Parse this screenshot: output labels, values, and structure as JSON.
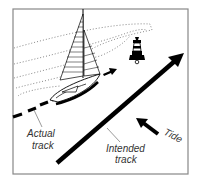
{
  "diagram": {
    "labels": {
      "actual_track": [
        "Actual",
        "track"
      ],
      "intended_track": [
        "Intended",
        "track"
      ],
      "tide": "Tide"
    },
    "elements": {
      "vessel": "sailboat",
      "landmark": "lighthouse-buoy",
      "tide_arrow_direction": "north-west",
      "intended_track_direction": "north-east"
    },
    "colors": {
      "ink": "#000000",
      "frame": "#888888",
      "label": "#333333",
      "background": "#ffffff"
    }
  }
}
